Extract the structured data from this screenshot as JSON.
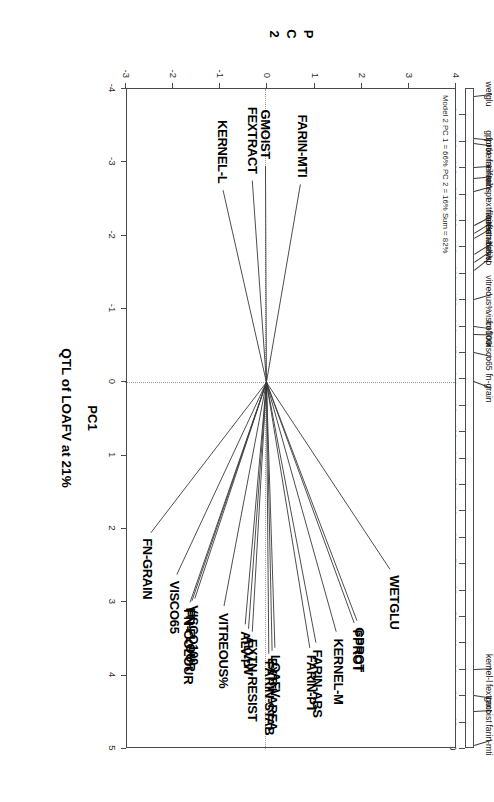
{
  "figure": {
    "main_title": "QTL of LOAFV at 21%",
    "xaxis_title": "PC1",
    "yaxis_title_chars": [
      "P",
      "C",
      "2"
    ],
    "corner_note": "Model 2 PC 1 = 66% PC 2 = 16% Sum = 82%"
  },
  "chart_data": {
    "type": "scatter",
    "title": "QTL of LOAFV at 21%",
    "subtitle": "Model 2 PC 1 = 66% PC 2 = 16% Sum = 82%",
    "xlabel": "PC1",
    "ylabel": "PC2",
    "xlim": [
      -4,
      5
    ],
    "ylim": [
      -3,
      4
    ],
    "xticks": [
      "-4",
      "-3",
      "-2",
      "-1",
      "0",
      "1",
      "2",
      "3",
      "4",
      "5"
    ],
    "yticks": [
      "-3",
      "-2",
      "-1",
      "0",
      "1",
      "2",
      "3",
      "4"
    ],
    "grid": false,
    "legend": "none",
    "note": "PCA biplot: each trait drawn as a ray from the origin (0,0) to its loading coordinate.",
    "vectors": [
      {
        "label": "WETGLU",
        "x": 2.55,
        "y": 2.62
      },
      {
        "label": "GPROT",
        "x": 3.25,
        "y": 1.92
      },
      {
        "label": "FPROT",
        "x": 3.28,
        "y": 1.86
      },
      {
        "label": "KERNEL-M",
        "x": 3.4,
        "y": 1.48
      },
      {
        "label": "FARIN-ABS",
        "x": 3.55,
        "y": 1.05
      },
      {
        "label": "FARIN-PT",
        "x": 3.62,
        "y": 0.92
      },
      {
        "label": "LOAFV",
        "x": 3.62,
        "y": 0.18
      },
      {
        "label": "EXTN-AREA",
        "x": 3.66,
        "y": 0.12
      },
      {
        "label": "FARIN-STAB",
        "x": 3.7,
        "y": 0.05
      },
      {
        "label": "EXTN-RESIST",
        "x": 3.4,
        "y": -0.3
      },
      {
        "label": "ALV-W",
        "x": 3.36,
        "y": -0.38
      },
      {
        "label": "ALV-P",
        "x": 3.3,
        "y": -0.45
      },
      {
        "label": "VITREOUS%",
        "x": 3.05,
        "y": -0.9
      },
      {
        "label": "VISCO100",
        "x": 2.95,
        "y": -1.52
      },
      {
        "label": "FN-FLOUR",
        "x": 2.98,
        "y": -1.58
      },
      {
        "label": "FN-COLOUR",
        "x": 3.0,
        "y": -1.62
      },
      {
        "label": "VISCO65",
        "x": 2.62,
        "y": -1.9
      },
      {
        "label": "FN-GRAIN",
        "x": 2.05,
        "y": -2.45
      },
      {
        "label": "FARIN-MTI",
        "x": -2.7,
        "y": 0.72
      },
      {
        "label": "GMOIST",
        "x": -2.95,
        "y": -0.02
      },
      {
        "label": "FEXTRACT",
        "x": -2.75,
        "y": -0.3
      },
      {
        "label": "KERNEL-L",
        "x": -2.62,
        "y": -0.92
      }
    ]
  },
  "ruler": {
    "axis_max": 250,
    "axis_min": 0,
    "tick_values": [
      240,
      230,
      220,
      210,
      200,
      190,
      180,
      170,
      160,
      150,
      140,
      130,
      120,
      110,
      100,
      90,
      80,
      70,
      60,
      50,
      40,
      30,
      20,
      10,
      0
    ],
    "tick_labels": [
      "240",
      "230",
      "220",
      "210",
      "200",
      "190",
      "180",
      "170",
      "160",
      "150",
      "140",
      "130",
      "120",
      "110",
      "100",
      "90",
      "80",
      "70",
      "60",
      "50",
      "40",
      "30",
      "20",
      "10",
      "0"
    ],
    "markers": [
      {
        "label": "wetglu",
        "pos": 247
      },
      {
        "label": "gprot",
        "pos": 231
      },
      {
        "label": "fprot",
        "pos": 229
      },
      {
        "label": "kernel-m",
        "pos": 220
      },
      {
        "label": "farin-abs",
        "pos": 216
      },
      {
        "label": "farin-pt",
        "pos": 211
      },
      {
        "label": "extn-area",
        "pos": 198
      },
      {
        "label": "loafv",
        "pos": 195
      },
      {
        "label": "farin-stab",
        "pos": 193
      },
      {
        "label": "extn-resist",
        "pos": 187
      },
      {
        "label": "alv-w",
        "pos": 184
      },
      {
        "label": "alv-p",
        "pos": 181
      },
      {
        "label": "vitreous%",
        "pos": 170
      },
      {
        "label": "visco100",
        "pos": 160
      },
      {
        "label": "fn-flour",
        "pos": 157
      },
      {
        "label": "visco65",
        "pos": 150
      },
      {
        "label": "fn-grain",
        "pos": 139
      },
      {
        "label": "kernel-l",
        "pos": 30
      },
      {
        "label": "fextract",
        "pos": 20
      },
      {
        "label": "gmoist",
        "pos": 14
      },
      {
        "label": "farin-mti",
        "pos": 1
      }
    ]
  }
}
